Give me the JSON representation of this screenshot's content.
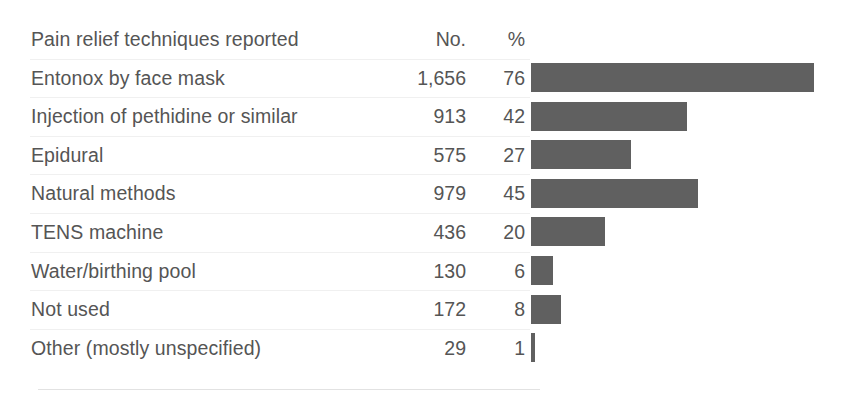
{
  "table": {
    "header": {
      "label": "Pain relief techniques reported",
      "no": "No.",
      "pct": "%"
    },
    "rows": [
      {
        "label": "Entonox by face mask",
        "no": "1,656",
        "pct": "76"
      },
      {
        "label": "Injection of pethidine or similar",
        "no": "913",
        "pct": "42"
      },
      {
        "label": "Epidural",
        "no": "575",
        "pct": "27"
      },
      {
        "label": "Natural methods",
        "no": "979",
        "pct": "45"
      },
      {
        "label": "TENS machine",
        "no": "436",
        "pct": "20"
      },
      {
        "label": "Water/birthing pool",
        "no": "130",
        "pct": "6"
      },
      {
        "label": "Not used",
        "no": "172",
        "pct": "8"
      },
      {
        "label": "Other (mostly unspecified)",
        "no": "29",
        "pct": "1"
      }
    ]
  },
  "style": {
    "bar_color": "#606060",
    "text_color": "#555555",
    "background": "#ffffff",
    "rule_color": "#e2e2e2"
  },
  "chart_data": {
    "type": "bar",
    "orientation": "horizontal",
    "title": "Pain relief techniques reported",
    "xlabel": "%",
    "ylabel": "",
    "categories": [
      "Entonox by face mask",
      "Injection of pethidine or similar",
      "Epidural",
      "Natural methods",
      "TENS machine",
      "Water/birthing pool",
      "Not used",
      "Other (mostly unspecified)"
    ],
    "values": [
      76,
      42,
      27,
      45,
      20,
      6,
      8,
      1
    ],
    "counts": [
      1656,
      913,
      575,
      979,
      436,
      130,
      172,
      29
    ],
    "xlim": [
      0,
      76
    ],
    "grid": false,
    "legend": false,
    "px_per_percent": 3.72,
    "bar_origin_px": 531
  }
}
